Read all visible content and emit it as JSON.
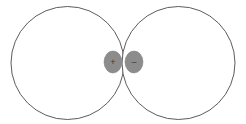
{
  "figure": {
    "background_color": "#ffffff",
    "width": 246,
    "height": 124,
    "circle_stroke_color": "#4a4a4a",
    "circle_stroke_width": 0.9,
    "circle_fill_color": "#ffffff",
    "marker_fill_color": "#8c8c8c",
    "marker_stroke_color": "#7a7a7a",
    "marker_symbol_color": "#3a3a3a",
    "circles": [
      {
        "name": "left-circle",
        "cx": 67.5,
        "cy": 63,
        "r": 56.5,
        "label": "Left circle"
      },
      {
        "name": "right-circle",
        "cx": 178.5,
        "cy": 63,
        "r": 56.5,
        "label": "Right circle"
      }
    ],
    "markers": [
      {
        "name": "left-charge-marker",
        "cx": 113,
        "cy": 62,
        "rx": 9,
        "ry": 11,
        "symbol": "+",
        "label": "Positive charge marker"
      },
      {
        "name": "right-charge-marker",
        "cx": 134,
        "cy": 62,
        "rx": 9,
        "ry": 11,
        "symbol": "–",
        "label": "Negative charge marker"
      }
    ]
  }
}
